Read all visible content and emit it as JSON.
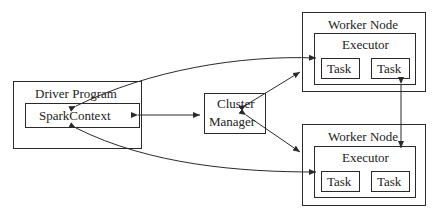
{
  "diagram": {
    "driver": {
      "label": "Driver Program",
      "context_label": "SparkContext"
    },
    "cluster_manager": {
      "label_line1": "Cluster",
      "label_line2": "Manager"
    },
    "workers": [
      {
        "label": "Worker Node",
        "executor_label": "Executor",
        "tasks": [
          "Task",
          "Task"
        ]
      },
      {
        "label": "Worker Node",
        "executor_label": "Executor",
        "tasks": [
          "Task",
          "Task"
        ]
      }
    ],
    "colors": {
      "stroke": "#2a2a2a",
      "text": "#222222",
      "background": "#ffffff"
    }
  }
}
